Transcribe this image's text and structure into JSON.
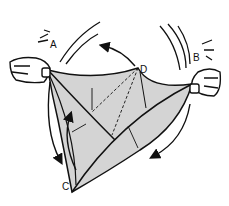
{
  "diagram": {
    "labels": {
      "A": "A",
      "B": "B",
      "C": "C",
      "D": "D"
    },
    "colors": {
      "paper_fill": "#d4d4d4",
      "ink": "#111111",
      "background": "#ffffff"
    }
  }
}
